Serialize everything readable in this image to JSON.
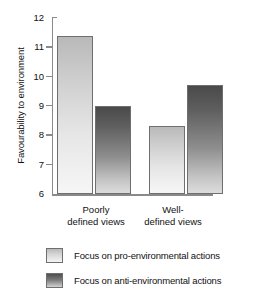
{
  "chart_data": {
    "type": "bar",
    "title": "",
    "subtitle": "",
    "xlabel": "",
    "ylabel": "Favourability to environment",
    "ylim": [
      6,
      12
    ],
    "yticks": [
      6,
      7,
      8,
      9,
      10,
      11,
      12
    ],
    "ytick_labels": [
      "6",
      "7",
      "8",
      "9",
      "10",
      "11",
      "12"
    ],
    "grid": false,
    "legend_position": "bottom-left",
    "categories": [
      "Poorly defined views",
      "Well-defined views"
    ],
    "category_lines": [
      [
        "Poorly",
        "defined views"
      ],
      [
        "Well-",
        "defined views"
      ]
    ],
    "series": [
      {
        "name": "Focus on pro-environmental actions",
        "values": [
          11.35,
          8.3
        ],
        "fill": "light-gradient",
        "color_top": "#b9b9b9",
        "color_bottom": "#f6f6f6"
      },
      {
        "name": "Focus on anti-environmental actions",
        "values": [
          9.0,
          9.7
        ],
        "fill": "dark-gradient",
        "color_top": "#4a4a4a",
        "color_bottom": "#dcdcdc"
      }
    ]
  },
  "axis": {
    "ylabel": "Favourability to environment",
    "tick_12": "12",
    "tick_11": "11",
    "tick_10": "10",
    "tick_9": "9",
    "tick_8": "8",
    "tick_7": "7",
    "tick_6": "6"
  },
  "categories": {
    "g0_line1": "Poorly",
    "g0_line2": "defined views",
    "g1_line1": "Well-",
    "g1_line2": "defined views"
  },
  "legend": {
    "item0_label": "Focus on pro-environmental actions",
    "item1_label": "Focus on anti-environmental actions"
  },
  "colors": {
    "axis": "#8a8a8a",
    "bar_outline": "#6f6f6f",
    "text": "#111111",
    "background": "#ffffff"
  }
}
